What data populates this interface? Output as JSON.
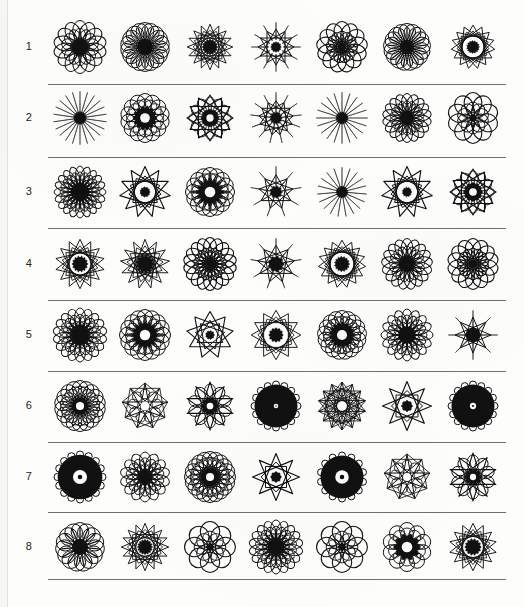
{
  "page": {
    "ink_color": "#111111",
    "paper_color": "#fdfdfc",
    "rule_color": "#6f6f6f",
    "columns": 7,
    "rows": 8
  },
  "rows": [
    {
      "number": "1",
      "cells": [
        {
          "name": "rosette-r1-c1",
          "petals": 14,
          "style": "loop-ring",
          "size": 52,
          "inner": 0.4,
          "lobe": 0.36,
          "fill": 0.55
        },
        {
          "name": "rosette-r1-c2",
          "petals": 18,
          "style": "spoke-ring",
          "size": 52,
          "inner": 0.3,
          "lobe": 0.3,
          "fill": 0.62
        },
        {
          "name": "rosette-r1-c3",
          "petals": 16,
          "style": "star-dense",
          "size": 48,
          "inner": 0.26,
          "lobe": 0.3,
          "fill": 0.7
        },
        {
          "name": "rosette-r1-c4",
          "petals": 12,
          "style": "star-spike",
          "size": 50,
          "inner": 0.2,
          "lobe": 0.34,
          "fill": 0.6
        },
        {
          "name": "rosette-r1-c5",
          "petals": 13,
          "style": "loop-open",
          "size": 48,
          "inner": 0.38,
          "lobe": 0.38,
          "fill": 0.3
        },
        {
          "name": "rosette-r1-c6",
          "petals": 17,
          "style": "spoke-ring",
          "size": 50,
          "inner": 0.28,
          "lobe": 0.3,
          "fill": 0.64
        },
        {
          "name": "rosette-r1-c7",
          "petals": 15,
          "style": "star-dense",
          "size": 46,
          "inner": 0.22,
          "lobe": 0.32,
          "fill": 0.72
        }
      ]
    },
    {
      "number": "2",
      "cells": [
        {
          "name": "rosette-r2-c1",
          "petals": 22,
          "style": "burst",
          "size": 54,
          "inner": 0.18,
          "lobe": 0.14,
          "fill": 0.85
        },
        {
          "name": "rosette-r2-c2",
          "petals": 14,
          "style": "ring-hole",
          "size": 50,
          "inner": 0.42,
          "lobe": 0.32,
          "fill": 0.7
        },
        {
          "name": "rosette-r2-c3",
          "petals": 12,
          "style": "star-hole",
          "size": 48,
          "inner": 0.36,
          "lobe": 0.36,
          "fill": 0.45
        },
        {
          "name": "rosette-r2-c4",
          "petals": 13,
          "style": "burst-star",
          "size": 52,
          "inner": 0.22,
          "lobe": 0.26,
          "fill": 0.66
        },
        {
          "name": "rosette-r2-c5",
          "petals": 20,
          "style": "burst",
          "size": 52,
          "inner": 0.18,
          "lobe": 0.14,
          "fill": 0.82
        },
        {
          "name": "rosette-r2-c6",
          "petals": 18,
          "style": "loop-ring",
          "size": 48,
          "inner": 0.3,
          "lobe": 0.3,
          "fill": 0.62
        },
        {
          "name": "rosette-r2-c7",
          "petals": 10,
          "style": "loop-open",
          "size": 48,
          "inner": 0.34,
          "lobe": 0.42,
          "fill": 0.38
        }
      ]
    },
    {
      "number": "3",
      "cells": [
        {
          "name": "rosette-r3-c1",
          "petals": 20,
          "style": "loop-dense",
          "size": 50,
          "inner": 0.4,
          "lobe": 0.26,
          "fill": 0.68
        },
        {
          "name": "rosette-r3-c2",
          "petals": 11,
          "style": "star-open",
          "size": 52,
          "inner": 0.3,
          "lobe": 0.42,
          "fill": 0.46
        },
        {
          "name": "rosette-r3-c3",
          "petals": 16,
          "style": "ring-hole",
          "size": 50,
          "inner": 0.46,
          "lobe": 0.28,
          "fill": 0.4
        },
        {
          "name": "rosette-r3-c4",
          "petals": 9,
          "style": "burst-star",
          "size": 52,
          "inner": 0.22,
          "lobe": 0.34,
          "fill": 0.6
        },
        {
          "name": "rosette-r3-c5",
          "petals": 19,
          "style": "burst",
          "size": 50,
          "inner": 0.18,
          "lobe": 0.15,
          "fill": 0.84
        },
        {
          "name": "rosette-r3-c6",
          "petals": 11,
          "style": "star-open",
          "size": 52,
          "inner": 0.28,
          "lobe": 0.42,
          "fill": 0.52
        },
        {
          "name": "rosette-r3-c7",
          "petals": 12,
          "style": "star-hole",
          "size": 48,
          "inner": 0.38,
          "lobe": 0.36,
          "fill": 0.48
        }
      ]
    },
    {
      "number": "4",
      "cells": [
        {
          "name": "rosette-r4-c1",
          "petals": 14,
          "style": "star-dense",
          "size": 52,
          "inner": 0.24,
          "lobe": 0.34,
          "fill": 0.66
        },
        {
          "name": "rosette-r4-c2",
          "petals": 13,
          "style": "star-dense",
          "size": 52,
          "inner": 0.28,
          "lobe": 0.34,
          "fill": 0.7
        },
        {
          "name": "rosette-r4-c3",
          "petals": 18,
          "style": "loop-open",
          "size": 50,
          "inner": 0.4,
          "lobe": 0.3,
          "fill": 0.36
        },
        {
          "name": "rosette-r4-c4",
          "petals": 9,
          "style": "star-spike",
          "size": 52,
          "inner": 0.3,
          "lobe": 0.4,
          "fill": 0.44
        },
        {
          "name": "rosette-r4-c5",
          "petals": 15,
          "style": "star-dense",
          "size": 50,
          "inner": 0.24,
          "lobe": 0.34,
          "fill": 0.62
        },
        {
          "name": "rosette-r4-c6",
          "petals": 17,
          "style": "loop-ring",
          "size": 50,
          "inner": 0.38,
          "lobe": 0.3,
          "fill": 0.52
        },
        {
          "name": "rosette-r4-c7",
          "petals": 14,
          "style": "loop-open",
          "size": 48,
          "inner": 0.38,
          "lobe": 0.36,
          "fill": 0.34
        }
      ]
    },
    {
      "number": "5",
      "cells": [
        {
          "name": "rosette-r5-c1",
          "petals": 18,
          "style": "loop-dense",
          "size": 52,
          "inner": 0.38,
          "lobe": 0.3,
          "fill": 0.58
        },
        {
          "name": "rosette-r5-c2",
          "petals": 16,
          "style": "ring-hole",
          "size": 52,
          "inner": 0.44,
          "lobe": 0.28,
          "fill": 0.64
        },
        {
          "name": "rosette-r5-c3",
          "petals": 9,
          "style": "star-open",
          "size": 48,
          "inner": 0.28,
          "lobe": 0.42,
          "fill": 0.5
        },
        {
          "name": "rosette-r5-c4",
          "petals": 12,
          "style": "star-dense",
          "size": 52,
          "inner": 0.22,
          "lobe": 0.36,
          "fill": 0.66
        },
        {
          "name": "rosette-r5-c5",
          "petals": 17,
          "style": "ring-hole",
          "size": 50,
          "inner": 0.44,
          "lobe": 0.28,
          "fill": 0.66
        },
        {
          "name": "rosette-r5-c6",
          "petals": 16,
          "style": "loop-dense",
          "size": 50,
          "inner": 0.36,
          "lobe": 0.3,
          "fill": 0.56
        },
        {
          "name": "rosette-r5-c7",
          "petals": 8,
          "style": "star-spike",
          "size": 50,
          "inner": 0.3,
          "lobe": 0.42,
          "fill": 0.48
        }
      ]
    },
    {
      "number": "6",
      "cells": [
        {
          "name": "rosette-r6-c1",
          "petals": 18,
          "style": "ring-hole",
          "size": 52,
          "inner": 0.34,
          "lobe": 0.3,
          "fill": 0.68
        },
        {
          "name": "rosette-r6-c2",
          "petals": 9,
          "style": "web-open",
          "size": 48,
          "inner": 0.34,
          "lobe": 0.36,
          "fill": 0.3
        },
        {
          "name": "rosette-r6-c3",
          "petals": 10,
          "style": "star-hole",
          "size": 50,
          "inner": 0.32,
          "lobe": 0.38,
          "fill": 0.52
        },
        {
          "name": "rosette-r6-c4",
          "petals": 16,
          "style": "ring-solid",
          "size": 50,
          "inner": 0.1,
          "lobe": 0.26,
          "fill": 0.92
        },
        {
          "name": "rosette-r6-c5",
          "petals": 14,
          "style": "web-open",
          "size": 50,
          "inner": 0.26,
          "lobe": 0.34,
          "fill": 0.34
        },
        {
          "name": "rosette-r6-c6",
          "petals": 8,
          "style": "star-open",
          "size": 50,
          "inner": 0.34,
          "lobe": 0.44,
          "fill": 0.42
        },
        {
          "name": "rosette-r6-c7",
          "petals": 16,
          "style": "ring-solid",
          "size": 50,
          "inner": 0.14,
          "lobe": 0.26,
          "fill": 0.88
        }
      ]
    },
    {
      "number": "7",
      "cells": [
        {
          "name": "rosette-r7-c1",
          "petals": 16,
          "style": "ring-solid",
          "size": 52,
          "inner": 0.3,
          "lobe": 0.22,
          "fill": 0.94
        },
        {
          "name": "rosette-r7-c2",
          "petals": 14,
          "style": "loop-dense",
          "size": 48,
          "inner": 0.28,
          "lobe": 0.34,
          "fill": 0.64
        },
        {
          "name": "rosette-r7-c3",
          "petals": 20,
          "style": "ring-hole",
          "size": 52,
          "inner": 0.34,
          "lobe": 0.26,
          "fill": 0.76
        },
        {
          "name": "rosette-r7-c4",
          "petals": 8,
          "style": "star-open",
          "size": 48,
          "inner": 0.34,
          "lobe": 0.44,
          "fill": 0.38
        },
        {
          "name": "rosette-r7-c5",
          "petals": 14,
          "style": "ring-solid",
          "size": 50,
          "inner": 0.3,
          "lobe": 0.22,
          "fill": 0.92
        },
        {
          "name": "rosette-r7-c6",
          "petals": 9,
          "style": "web-open",
          "size": 48,
          "inner": 0.3,
          "lobe": 0.38,
          "fill": 0.3
        },
        {
          "name": "rosette-r7-c7",
          "petals": 10,
          "style": "star-hole",
          "size": 50,
          "inner": 0.3,
          "lobe": 0.4,
          "fill": 0.5
        }
      ]
    },
    {
      "number": "8",
      "cells": [
        {
          "name": "rosette-r8-c1",
          "petals": 15,
          "style": "spoke-ring",
          "size": 52,
          "inner": 0.32,
          "lobe": 0.32,
          "fill": 0.6
        },
        {
          "name": "rosette-r8-c2",
          "petals": 16,
          "style": "star-dense",
          "size": 50,
          "inner": 0.24,
          "lobe": 0.34,
          "fill": 0.72
        },
        {
          "name": "rosette-r8-c3",
          "petals": 8,
          "style": "loop-open",
          "size": 48,
          "inner": 0.34,
          "lobe": 0.46,
          "fill": 0.22
        },
        {
          "name": "rosette-r8-c4",
          "petals": 18,
          "style": "loop-dense",
          "size": 52,
          "inner": 0.34,
          "lobe": 0.3,
          "fill": 0.7
        },
        {
          "name": "rosette-r8-c5",
          "petals": 8,
          "style": "loop-open",
          "size": 48,
          "inner": 0.34,
          "lobe": 0.46,
          "fill": 0.22
        },
        {
          "name": "rosette-r8-c6",
          "petals": 10,
          "style": "ring-hole",
          "size": 50,
          "inner": 0.46,
          "lobe": 0.3,
          "fill": 0.76
        },
        {
          "name": "rosette-r8-c7",
          "petals": 14,
          "style": "star-dense",
          "size": 50,
          "inner": 0.26,
          "lobe": 0.32,
          "fill": 0.76
        }
      ]
    }
  ],
  "layout": {
    "row_tops": [
      11,
      82,
      156,
      228,
      299,
      370,
      441,
      511
    ],
    "separator_tops": [
      84,
      157,
      228,
      300,
      371,
      442,
      512,
      579
    ],
    "column_lefts": [
      1,
      66,
      131,
      197,
      263,
      328,
      394
    ]
  }
}
